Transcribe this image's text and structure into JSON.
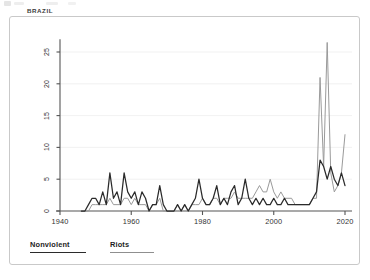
{
  "panel": {
    "title": "BRAZIL"
  },
  "legend": {
    "items": [
      {
        "label": "Nonviolent",
        "color": "#2b2b2b",
        "key": "nonviolent"
      },
      {
        "label": "Riots",
        "color": "#9a9a9a",
        "key": "riots"
      }
    ]
  },
  "colors": {
    "nonviolent": "#2b2b2b",
    "riots": "#9a9a9a",
    "axis": "#555555",
    "grid": "#ededed",
    "frame": "#c9c9c9",
    "text": "#333333",
    "background": "#ffffff"
  },
  "chart_data": {
    "type": "line",
    "title": "BRAZIL",
    "xlabel": "",
    "ylabel": "",
    "xlim": [
      1940,
      2022
    ],
    "ylim": [
      0,
      27
    ],
    "xticks": [
      1940,
      1960,
      1980,
      2000,
      2020
    ],
    "yticks": [
      0,
      5,
      10,
      15,
      20,
      25
    ],
    "grid": true,
    "grid_axis": "y",
    "legend_position": "bottom-left",
    "x": [
      1946,
      1947,
      1948,
      1949,
      1950,
      1951,
      1952,
      1953,
      1954,
      1955,
      1956,
      1957,
      1958,
      1959,
      1960,
      1961,
      1962,
      1963,
      1964,
      1965,
      1966,
      1967,
      1968,
      1969,
      1970,
      1971,
      1972,
      1973,
      1974,
      1975,
      1976,
      1977,
      1978,
      1979,
      1980,
      1981,
      1982,
      1983,
      1984,
      1985,
      1986,
      1987,
      1988,
      1989,
      1990,
      1991,
      1992,
      1993,
      1994,
      1995,
      1996,
      1997,
      1998,
      1999,
      2000,
      2001,
      2002,
      2003,
      2004,
      2005,
      2006,
      2007,
      2008,
      2009,
      2010,
      2011,
      2012,
      2013,
      2014,
      2015,
      2016,
      2017,
      2018,
      2019,
      2020
    ],
    "series": [
      {
        "name": "Nonviolent",
        "color": "#2b2b2b",
        "values": [
          0,
          0,
          1,
          2,
          2,
          1,
          3,
          1,
          6,
          2,
          3,
          1,
          6,
          3,
          2,
          3,
          1,
          3,
          2,
          0,
          1,
          1,
          4,
          1,
          0,
          0,
          0,
          1,
          0,
          1,
          0,
          1,
          2,
          5,
          2,
          1,
          1,
          2,
          4,
          1,
          2,
          1,
          3,
          4,
          1,
          2,
          5,
          2,
          1,
          2,
          1,
          2,
          1,
          1,
          2,
          1,
          1,
          2,
          1,
          1,
          1,
          1,
          1,
          1,
          1,
          2,
          3,
          8,
          7,
          5,
          7,
          5,
          4,
          6,
          4
        ]
      },
      {
        "name": "Riots",
        "color": "#9a9a9a",
        "values": [
          0,
          0,
          0,
          1,
          1,
          1,
          1,
          1,
          2,
          1,
          1,
          1,
          2,
          2,
          1,
          2,
          1,
          1,
          1,
          0,
          1,
          1,
          2,
          0,
          0,
          0,
          0,
          1,
          0,
          1,
          0,
          1,
          1,
          1,
          2,
          1,
          1,
          2,
          2,
          1,
          2,
          2,
          2,
          3,
          2,
          2,
          2,
          2,
          2,
          3,
          4,
          3,
          3,
          5,
          3,
          2,
          3,
          2,
          2,
          2,
          1,
          1,
          1,
          1,
          1,
          2,
          2,
          21,
          7,
          26.5,
          6,
          3,
          4,
          6,
          12
        ]
      }
    ]
  }
}
